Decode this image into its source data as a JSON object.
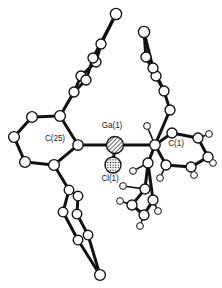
{
  "figure": {
    "kind": "ortep-crystal-structure-diagram",
    "background_color": "#ffffff",
    "line_color": "#111111",
    "atom_fill_color": "#ffffff",
    "atom_stroke_color": "#111111",
    "width": 222,
    "height": 288
  },
  "labels": {
    "gallium": "Ga(1)",
    "chlorine": "Cl(1)",
    "carbon_25": "C(25)",
    "carbon_1": "C(1)"
  },
  "chart_data": {
    "type": "diagram",
    "title": "",
    "atoms": [
      {
        "id": "Ga1",
        "element": "Ga",
        "label": "Ga(1)",
        "x": 115,
        "y": 145,
        "r": 8.5,
        "style": "hatched"
      },
      {
        "id": "Cl1",
        "element": "Cl",
        "label": "Cl(1)",
        "x": 113,
        "y": 165,
        "r": 8.0,
        "style": "stippled"
      },
      {
        "id": "C25",
        "element": "C",
        "label": "C(25)",
        "x": 78,
        "y": 145,
        "r": 5.2,
        "style": "open"
      },
      {
        "id": "C1",
        "element": "C",
        "label": "C(1)",
        "x": 155,
        "y": 145,
        "r": 5.2,
        "style": "open"
      },
      {
        "id": "L1",
        "element": "C",
        "label": "",
        "x": 60,
        "y": 116,
        "r": 5.4,
        "style": "open"
      },
      {
        "id": "L2",
        "element": "C",
        "label": "",
        "x": 32,
        "y": 117,
        "r": 5.4,
        "style": "open"
      },
      {
        "id": "L3",
        "element": "C",
        "label": "",
        "x": 14,
        "y": 137,
        "r": 5.4,
        "style": "open"
      },
      {
        "id": "L4",
        "element": "C",
        "label": "",
        "x": 25,
        "y": 162,
        "r": 5.4,
        "style": "open"
      },
      {
        "id": "L5",
        "element": "C",
        "label": "",
        "x": 54,
        "y": 165,
        "r": 5.4,
        "style": "open"
      },
      {
        "id": "UA1",
        "element": "C",
        "label": "",
        "x": 74,
        "y": 92,
        "r": 5.0,
        "style": "open"
      },
      {
        "id": "UA2",
        "element": "C",
        "label": "",
        "x": 81,
        "y": 76,
        "r": 5.0,
        "style": "open"
      },
      {
        "id": "UA3",
        "element": "C",
        "label": "",
        "x": 96,
        "y": 62,
        "r": 5.0,
        "style": "open"
      },
      {
        "id": "UA4",
        "element": "C",
        "label": "",
        "x": 101,
        "y": 44,
        "r": 5.0,
        "style": "open"
      },
      {
        "id": "UA5",
        "element": "C",
        "label": "",
        "x": 93,
        "y": 58,
        "r": 5.0,
        "style": "open"
      },
      {
        "id": "UA6",
        "element": "C",
        "label": "",
        "x": 86,
        "y": 80,
        "r": 5.0,
        "style": "open"
      },
      {
        "id": "UA7",
        "element": "C",
        "label": "",
        "x": 116,
        "y": 14,
        "r": 5.6,
        "style": "open"
      },
      {
        "id": "UB1",
        "element": "C",
        "label": "",
        "x": 170,
        "y": 110,
        "r": 5.0,
        "style": "open"
      },
      {
        "id": "UB2",
        "element": "C",
        "label": "",
        "x": 164,
        "y": 91,
        "r": 5.0,
        "style": "open"
      },
      {
        "id": "UB3",
        "element": "C",
        "label": "",
        "x": 156,
        "y": 76,
        "r": 5.0,
        "style": "open"
      },
      {
        "id": "UB4",
        "element": "C",
        "label": "",
        "x": 146,
        "y": 57,
        "r": 5.0,
        "style": "open"
      },
      {
        "id": "UB5",
        "element": "C",
        "label": "",
        "x": 153,
        "y": 68,
        "r": 5.0,
        "style": "open"
      },
      {
        "id": "UB6",
        "element": "C",
        "label": "",
        "x": 144,
        "y": 32,
        "r": 5.6,
        "style": "open"
      },
      {
        "id": "RA1",
        "element": "C",
        "label": "",
        "x": 172,
        "y": 133,
        "r": 5.0,
        "style": "open"
      },
      {
        "id": "RA2",
        "element": "C",
        "label": "",
        "x": 198,
        "y": 138,
        "r": 5.0,
        "style": "open"
      },
      {
        "id": "RA3",
        "element": "C",
        "label": "",
        "x": 208,
        "y": 157,
        "r": 5.0,
        "style": "open"
      },
      {
        "id": "RA4",
        "element": "C",
        "label": "",
        "x": 191,
        "y": 167,
        "r": 5.0,
        "style": "open"
      },
      {
        "id": "RA5",
        "element": "C",
        "label": "",
        "x": 166,
        "y": 165,
        "r": 5.0,
        "style": "open"
      },
      {
        "id": "RB1",
        "element": "C",
        "label": "",
        "x": 148,
        "y": 163,
        "r": 5.0,
        "style": "open"
      },
      {
        "id": "RB2",
        "element": "C",
        "label": "",
        "x": 145,
        "y": 189,
        "r": 5.0,
        "style": "open"
      },
      {
        "id": "RB3",
        "element": "C",
        "label": "",
        "x": 132,
        "y": 205,
        "r": 5.0,
        "style": "open"
      },
      {
        "id": "RB4",
        "element": "C",
        "label": "",
        "x": 144,
        "y": 215,
        "r": 5.0,
        "style": "open"
      },
      {
        "id": "RB5",
        "element": "C",
        "label": "",
        "x": 153,
        "y": 200,
        "r": 5.0,
        "style": "open"
      },
      {
        "id": "LB1",
        "element": "C",
        "label": "",
        "x": 69,
        "y": 190,
        "r": 4.8,
        "style": "open"
      },
      {
        "id": "LB2",
        "element": "C",
        "label": "",
        "x": 78,
        "y": 196,
        "r": 4.8,
        "style": "open"
      },
      {
        "id": "LB3",
        "element": "C",
        "label": "",
        "x": 63,
        "y": 212,
        "r": 4.8,
        "style": "open"
      },
      {
        "id": "LB4",
        "element": "C",
        "label": "",
        "x": 77,
        "y": 214,
        "r": 4.8,
        "style": "open"
      },
      {
        "id": "LB5",
        "element": "C",
        "label": "",
        "x": 88,
        "y": 235,
        "r": 4.8,
        "style": "open"
      },
      {
        "id": "LB6",
        "element": "C",
        "label": "",
        "x": 78,
        "y": 240,
        "r": 4.8,
        "style": "open"
      },
      {
        "id": "LB7",
        "element": "C",
        "label": "",
        "x": 100,
        "y": 275,
        "r": 5.4,
        "style": "open"
      },
      {
        "id": "H1",
        "element": "H",
        "label": "",
        "x": 147,
        "y": 126,
        "r": 3.4,
        "style": "open"
      },
      {
        "id": "H2",
        "element": "H",
        "label": "",
        "x": 209,
        "y": 134,
        "r": 3.4,
        "style": "open"
      },
      {
        "id": "H3",
        "element": "H",
        "label": "",
        "x": 213,
        "y": 163,
        "r": 3.4,
        "style": "open"
      },
      {
        "id": "H4",
        "element": "H",
        "label": "",
        "x": 194,
        "y": 175,
        "r": 3.4,
        "style": "open"
      },
      {
        "id": "H5",
        "element": "H",
        "label": "",
        "x": 160,
        "y": 178,
        "r": 3.4,
        "style": "open"
      },
      {
        "id": "H6",
        "element": "H",
        "label": "",
        "x": 133,
        "y": 171,
        "r": 3.4,
        "style": "open"
      },
      {
        "id": "H7",
        "element": "H",
        "label": "",
        "x": 120,
        "y": 201,
        "r": 3.4,
        "style": "open"
      },
      {
        "id": "H8",
        "element": "H",
        "label": "",
        "x": 140,
        "y": 226,
        "r": 3.4,
        "style": "open"
      },
      {
        "id": "H9",
        "element": "H",
        "label": "",
        "x": 158,
        "y": 211,
        "r": 3.4,
        "style": "open"
      },
      {
        "id": "H10",
        "element": "H",
        "label": "",
        "x": 123,
        "y": 186,
        "r": 3.4,
        "style": "open"
      }
    ],
    "bonds": [
      {
        "from": "C25",
        "to": "Ga1",
        "order": 1
      },
      {
        "from": "Ga1",
        "to": "C1",
        "order": 1
      },
      {
        "from": "Ga1",
        "to": "Cl1",
        "order": 1
      },
      {
        "from": "C25",
        "to": "L1",
        "order": 1
      },
      {
        "from": "L1",
        "to": "L2",
        "order": 1
      },
      {
        "from": "L2",
        "to": "L3",
        "order": 1
      },
      {
        "from": "L3",
        "to": "L4",
        "order": 1
      },
      {
        "from": "L4",
        "to": "L5",
        "order": 1
      },
      {
        "from": "L5",
        "to": "C25",
        "order": 1
      },
      {
        "from": "L1",
        "to": "UA1",
        "order": 1
      },
      {
        "from": "UA1",
        "to": "UA2",
        "order": 1
      },
      {
        "from": "UA2",
        "to": "UA3",
        "order": 1
      },
      {
        "from": "UA3",
        "to": "UA4",
        "order": 1
      },
      {
        "from": "UA4",
        "to": "UA7",
        "order": 1
      },
      {
        "from": "UA1",
        "to": "UA6",
        "order": 1
      },
      {
        "from": "UA6",
        "to": "UA5",
        "order": 1
      },
      {
        "from": "UA5",
        "to": "UA7",
        "order": 1
      },
      {
        "from": "C1",
        "to": "UB1",
        "order": 1
      },
      {
        "from": "UB1",
        "to": "UB2",
        "order": 1
      },
      {
        "from": "UB2",
        "to": "UB3",
        "order": 1
      },
      {
        "from": "UB3",
        "to": "UB4",
        "order": 1
      },
      {
        "from": "UB4",
        "to": "UB6",
        "order": 1
      },
      {
        "from": "UB2",
        "to": "UB5",
        "order": 1
      },
      {
        "from": "UB5",
        "to": "UB6",
        "order": 1
      },
      {
        "from": "C1",
        "to": "RA1",
        "order": 1
      },
      {
        "from": "RA1",
        "to": "RA2",
        "order": 1
      },
      {
        "from": "RA2",
        "to": "RA3",
        "order": 1
      },
      {
        "from": "RA3",
        "to": "RA4",
        "order": 1
      },
      {
        "from": "RA4",
        "to": "RA5",
        "order": 1
      },
      {
        "from": "RA5",
        "to": "C1",
        "order": 1
      },
      {
        "from": "C1",
        "to": "RB1",
        "order": 1
      },
      {
        "from": "RB1",
        "to": "RB2",
        "order": 1
      },
      {
        "from": "RB2",
        "to": "RB3",
        "order": 1
      },
      {
        "from": "RB3",
        "to": "RB4",
        "order": 1
      },
      {
        "from": "RB4",
        "to": "RB5",
        "order": 1
      },
      {
        "from": "RB5",
        "to": "RB1",
        "order": 1
      },
      {
        "from": "L5",
        "to": "LB1",
        "order": 1
      },
      {
        "from": "LB1",
        "to": "LB2",
        "order": 1
      },
      {
        "from": "LB1",
        "to": "LB3",
        "order": 1
      },
      {
        "from": "LB2",
        "to": "LB4",
        "order": 1
      },
      {
        "from": "LB3",
        "to": "LB6",
        "order": 1
      },
      {
        "from": "LB4",
        "to": "LB5",
        "order": 1
      },
      {
        "from": "LB5",
        "to": "LB7",
        "order": 1
      },
      {
        "from": "LB6",
        "to": "LB7",
        "order": 1
      },
      {
        "from": "C1",
        "to": "H1",
        "order": 1
      },
      {
        "from": "RA2",
        "to": "H2",
        "order": 1
      },
      {
        "from": "RA3",
        "to": "H3",
        "order": 1
      },
      {
        "from": "RA4",
        "to": "H4",
        "order": 1
      },
      {
        "from": "RA5",
        "to": "H5",
        "order": 1
      },
      {
        "from": "RB1",
        "to": "H6",
        "order": 1
      },
      {
        "from": "RB3",
        "to": "H7",
        "order": 1
      },
      {
        "from": "RB4",
        "to": "H8",
        "order": 1
      },
      {
        "from": "RB5",
        "to": "H9",
        "order": 1
      },
      {
        "from": "RB2",
        "to": "H10",
        "order": 1
      }
    ],
    "label_positions": [
      {
        "text_key": "gallium",
        "x": 112,
        "y": 128,
        "anchor": "middle"
      },
      {
        "text_key": "chlorine",
        "x": 110,
        "y": 181,
        "anchor": "middle"
      },
      {
        "text_key": "carbon_25",
        "x": 55,
        "y": 141,
        "anchor": "middle"
      },
      {
        "text_key": "carbon_1",
        "x": 176,
        "y": 146,
        "anchor": "middle"
      }
    ]
  }
}
